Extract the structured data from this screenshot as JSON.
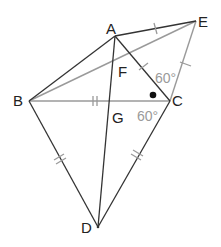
{
  "diagram": {
    "type": "geometry",
    "points": {
      "A": {
        "label": "A",
        "x": 115,
        "y": 36
      },
      "E": {
        "label": "E",
        "x": 196,
        "y": 21
      },
      "B": {
        "label": "B",
        "x": 29,
        "y": 101
      },
      "C": {
        "label": "C",
        "x": 170,
        "y": 101
      },
      "D": {
        "label": "D",
        "x": 98,
        "y": 227
      },
      "F": {
        "label": "F"
      },
      "G": {
        "label": "G"
      }
    },
    "angles": {
      "ECA": "60°",
      "ACB": "60°"
    },
    "colors": {
      "black_line": "#333333",
      "gray_line": "#9a9a9a",
      "gray_text": "#9a9a9a"
    }
  }
}
